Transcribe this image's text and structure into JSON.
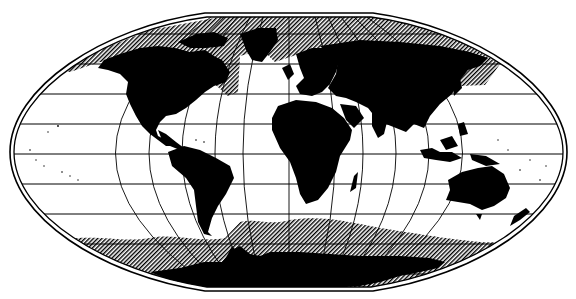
{
  "map": {
    "projection": "flat-polar-oval",
    "style": "black-land-on-white-with-hatched-ice",
    "colors": {
      "background": "#ffffff",
      "land": "#000000",
      "graticule": "#000000",
      "hatch_fg": "#000000",
      "hatch_bg": "#ffffff"
    },
    "layers": [
      {
        "name": "land",
        "label": "Continents"
      },
      {
        "name": "sea-ice",
        "label": "Sea ice extent (hatched)"
      },
      {
        "name": "graticule",
        "label": "Graticule"
      }
    ],
    "continents": [
      "North America",
      "South America",
      "Europe",
      "Asia",
      "Africa",
      "Australia",
      "Antarctica",
      "Greenland"
    ],
    "graticule": {
      "parallels_y": [
        34,
        64,
        94,
        124,
        154,
        184,
        214,
        244,
        274
      ],
      "meridians_x_at_equator": [
        60,
        106,
        152,
        198,
        243,
        289,
        335,
        380,
        425,
        471,
        516
      ]
    }
  }
}
